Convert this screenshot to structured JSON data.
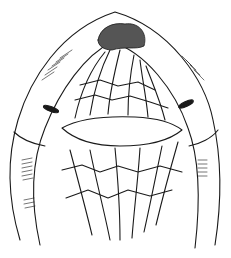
{
  "figure": {
    "type": "line-illustration",
    "colors": {
      "ink": "#1a1a1a",
      "background": "#ffffff"
    },
    "caption": ""
  }
}
